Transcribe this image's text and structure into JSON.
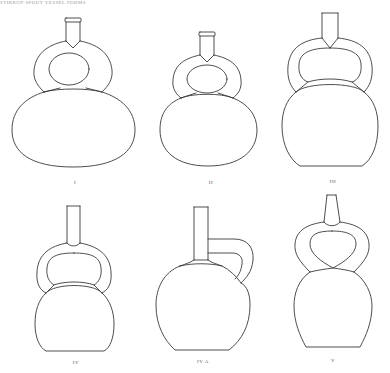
{
  "header": {
    "text": "STIRRUP-SPOUT VESSEL FORMS"
  },
  "figure": {
    "type": "line-drawing",
    "stroke_color": "#3a3a3a",
    "background": "#ffffff",
    "vessels": [
      {
        "id": "I",
        "label": "I",
        "row": 1,
        "col": 1,
        "description": "wide oval body, flared rim spout, round stirrup"
      },
      {
        "id": "II",
        "label": "II",
        "row": 1,
        "col": 2,
        "description": "smaller oval body, flared rim spout, round stirrup"
      },
      {
        "id": "III",
        "label": "III",
        "row": 1,
        "col": 3,
        "description": "round body flat base, straight spout, wide stirrup"
      },
      {
        "id": "IV",
        "label": "IV",
        "row": 2,
        "col": 1,
        "description": "kettle body flat base, straight spout, stirrup"
      },
      {
        "id": "IVA",
        "label": "IV A",
        "row": 2,
        "col": 2,
        "description": "globular body, tall spout with side handle"
      },
      {
        "id": "V",
        "label": "V",
        "row": 2,
        "col": 3,
        "description": "pear body, tapered spout, crossed stirrup"
      }
    ]
  }
}
